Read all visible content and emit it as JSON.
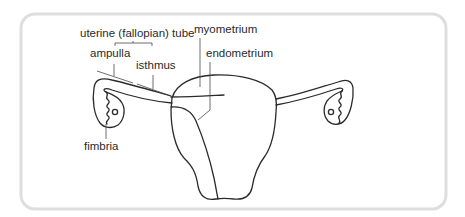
{
  "diagram": {
    "labels": {
      "uterine_tube": "uterine (fallopian) tube",
      "ampulla": "ampulla",
      "isthmus": "isthmus",
      "myometrium": "myometrium",
      "endometrium": "endometrium",
      "fimbria": "fimbria"
    },
    "colors": {
      "ink": "#2b2b2b",
      "frame": "#dedede",
      "background": "#ffffff"
    }
  }
}
